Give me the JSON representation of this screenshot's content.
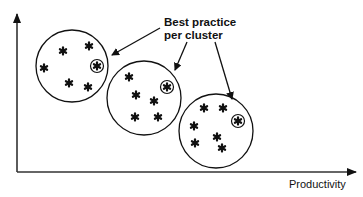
{
  "diagram": {
    "callout": {
      "line1": "Best practice",
      "line2": "per cluster"
    },
    "x_axis_label": "Productivity",
    "y_axis_label": "",
    "colors": {
      "ink": "#111111",
      "axis": "#333333",
      "background": "#ffffff"
    },
    "axes": {
      "origin": [
        17,
        172
      ],
      "y_tip": [
        17,
        13
      ],
      "x_tip": [
        356,
        172
      ]
    },
    "clusters": [
      {
        "name": "cluster-1",
        "center": [
          72,
          66
        ],
        "radius": 36,
        "points": [
          [
            63,
            51
          ],
          [
            89,
            46
          ],
          [
            44,
            68
          ],
          [
            69,
            83
          ],
          [
            88,
            87
          ]
        ],
        "best_practice": [
          97,
          66
        ]
      },
      {
        "name": "cluster-2",
        "center": [
          144,
          98
        ],
        "radius": 37,
        "points": [
          [
            129,
            77
          ],
          [
            136,
            95
          ],
          [
            154,
            101
          ],
          [
            135,
            117
          ],
          [
            158,
            117
          ]
        ],
        "best_practice": [
          167,
          87
        ]
      },
      {
        "name": "cluster-3",
        "center": [
          216,
          131
        ],
        "radius": 37,
        "points": [
          [
            204,
            108
          ],
          [
            223,
            108
          ],
          [
            194,
            126
          ],
          [
            217,
            137
          ],
          [
            195,
            143
          ],
          [
            222,
            148
          ]
        ],
        "best_practice": [
          238,
          121
        ]
      }
    ],
    "arrows": [
      {
        "from": [
          160,
          28
        ],
        "to": [
          112,
          55
        ]
      },
      {
        "from": [
          187,
          42
        ],
        "to": [
          175,
          70
        ]
      },
      {
        "from": [
          215,
          42
        ],
        "to": [
          232,
          99
        ]
      }
    ]
  }
}
